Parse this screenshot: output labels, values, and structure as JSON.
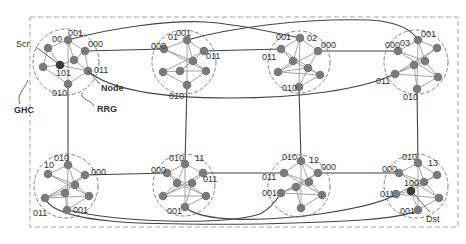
{
  "diagram": {
    "labels": {
      "ghc": "GHC",
      "rrg": "RRG",
      "node": "Node",
      "src": "Scr.",
      "dst": "Dst"
    },
    "colors": {
      "node": "#7a7a7a",
      "special_node": "#3a3a3a",
      "edge_inner": "#9a9a9a",
      "edge_outer": "#444444",
      "boundary": "#999999",
      "text": "#333333"
    },
    "boundary": {
      "x": 30,
      "y": 17,
      "w": 428,
      "h": 210
    },
    "clusters": [
      {
        "id": "00",
        "cx": 66,
        "cy": 62,
        "r": 33,
        "nodes": [
          [
            68,
            40
          ],
          [
            85,
            51
          ],
          [
            48,
            48
          ],
          [
            74,
            60
          ],
          [
            43,
            67
          ],
          [
            60,
            65
          ],
          [
            88,
            71
          ],
          [
            68,
            84
          ]
        ],
        "special": 5,
        "ports": [
          {
            "t": "001",
            "x": 68,
            "y": 36
          },
          {
            "t": "000",
            "x": 88,
            "y": 47
          },
          {
            "t": "011",
            "x": 94,
            "y": 73
          },
          {
            "t": "010",
            "x": 52,
            "y": 96
          },
          {
            "t": "101",
            "x": 56,
            "y": 76
          }
        ],
        "name_label": {
          "t": "00",
          "x": 52,
          "y": 42
        }
      },
      {
        "id": "01",
        "cx": 184,
        "cy": 62,
        "r": 32,
        "nodes": [
          [
            187,
            40
          ],
          [
            164,
            49
          ],
          [
            204,
            51
          ],
          [
            193,
            61
          ],
          [
            163,
            72
          ],
          [
            180,
            71
          ],
          [
            206,
            71
          ],
          [
            187,
            85
          ]
        ],
        "ports": [
          {
            "t": "001",
            "x": 176,
            "y": 36
          },
          {
            "t": "000",
            "x": 151,
            "y": 49
          },
          {
            "t": "011",
            "x": 206,
            "y": 59
          },
          {
            "t": "010",
            "x": 169,
            "y": 99
          }
        ],
        "name_label": {
          "t": "01",
          "x": 168,
          "y": 40
        }
      },
      {
        "id": "02",
        "cx": 299,
        "cy": 62,
        "r": 31,
        "nodes": [
          [
            300,
            38
          ],
          [
            281,
            49
          ],
          [
            318,
            51
          ],
          [
            293,
            61
          ],
          [
            308,
            68
          ],
          [
            278,
            72
          ],
          [
            320,
            75
          ],
          [
            299,
            87
          ]
        ],
        "ports": [
          {
            "t": "001",
            "x": 276,
            "y": 40
          },
          {
            "t": "000",
            "x": 321,
            "y": 48
          },
          {
            "t": "011",
            "x": 262,
            "y": 60
          },
          {
            "t": "010",
            "x": 282,
            "y": 91
          }
        ],
        "name_label": {
          "t": "02",
          "x": 307,
          "y": 41
        }
      },
      {
        "id": "03",
        "cx": 416,
        "cy": 62,
        "r": 32,
        "nodes": [
          [
            418,
            40
          ],
          [
            398,
            51
          ],
          [
            437,
            48
          ],
          [
            425,
            61
          ],
          [
            414,
            65
          ],
          [
            395,
            74
          ],
          [
            438,
            77
          ],
          [
            417,
            89
          ]
        ],
        "ports": [
          {
            "t": "001",
            "x": 421,
            "y": 37
          },
          {
            "t": "000",
            "x": 385,
            "y": 48
          },
          {
            "t": "011",
            "x": 376,
            "y": 84
          },
          {
            "t": "010",
            "x": 403,
            "y": 100
          }
        ],
        "name_label": {
          "t": "03",
          "x": 400,
          "y": 46
        }
      },
      {
        "id": "10",
        "cx": 66,
        "cy": 186,
        "r": 32,
        "nodes": [
          [
            68,
            165
          ],
          [
            48,
            174
          ],
          [
            85,
            175
          ],
          [
            75,
            185
          ],
          [
            65,
            193
          ],
          [
            45,
            198
          ],
          [
            89,
            196
          ],
          [
            67,
            210
          ]
        ],
        "ports": [
          {
            "t": "010",
            "x": 54,
            "y": 161
          },
          {
            "t": "000",
            "x": 91,
            "y": 175
          },
          {
            "t": "011",
            "x": 33,
            "y": 216
          },
          {
            "t": "001",
            "x": 73,
            "y": 213
          }
        ],
        "name_label": {
          "t": "10",
          "x": 44,
          "y": 168
        }
      },
      {
        "id": "11",
        "cx": 184,
        "cy": 185,
        "r": 31,
        "nodes": [
          [
            185,
            164
          ],
          [
            167,
            173
          ],
          [
            203,
            173
          ],
          [
            177,
            183
          ],
          [
            192,
            183
          ],
          [
            163,
            196
          ],
          [
            206,
            196
          ],
          [
            185,
            207
          ]
        ],
        "ports": [
          {
            "t": "010",
            "x": 169,
            "y": 161
          },
          {
            "t": "000",
            "x": 151,
            "y": 173
          },
          {
            "t": "011",
            "x": 203,
            "y": 182
          },
          {
            "t": "001",
            "x": 167,
            "y": 214
          }
        ],
        "name_label": {
          "t": "11",
          "x": 195,
          "y": 161
        }
      },
      {
        "id": "12",
        "cx": 299,
        "cy": 186,
        "r": 31,
        "nodes": [
          [
            301,
            161
          ],
          [
            284,
            173
          ],
          [
            318,
            173
          ],
          [
            309,
            182
          ],
          [
            296,
            187
          ],
          [
            281,
            193
          ],
          [
            322,
            195
          ],
          [
            301,
            208
          ]
        ],
        "ports": [
          {
            "t": "010",
            "x": 282,
            "y": 160
          },
          {
            "t": "000",
            "x": 321,
            "y": 170
          },
          {
            "t": "011",
            "x": 262,
            "y": 180
          },
          {
            "t": "001",
            "x": 262,
            "y": 196
          }
        ],
        "name_label": {
          "t": "12",
          "x": 309,
          "y": 163
        }
      },
      {
        "id": "13",
        "cx": 416,
        "cy": 186,
        "r": 32,
        "nodes": [
          [
            418,
            163
          ],
          [
            399,
            173
          ],
          [
            437,
            175
          ],
          [
            424,
            182
          ],
          [
            411,
            191
          ],
          [
            396,
            194
          ],
          [
            439,
            198
          ],
          [
            418,
            210
          ]
        ],
        "special": 4,
        "ports": [
          {
            "t": "010",
            "x": 402,
            "y": 160
          },
          {
            "t": "000",
            "x": 382,
            "y": 172
          },
          {
            "t": "011",
            "x": 380,
            "y": 197
          },
          {
            "t": "001",
            "x": 400,
            "y": 214
          },
          {
            "t": "100",
            "x": 404,
            "y": 186
          }
        ],
        "name_label": {
          "t": "13",
          "x": 428,
          "y": 166
        }
      }
    ],
    "inner_edges": [
      [
        0,
        1
      ],
      [
        0,
        2
      ],
      [
        0,
        3
      ],
      [
        1,
        3
      ],
      [
        1,
        6
      ],
      [
        2,
        4
      ],
      [
        2,
        5
      ],
      [
        3,
        5
      ],
      [
        4,
        5
      ],
      [
        4,
        7
      ],
      [
        5,
        6
      ],
      [
        6,
        7
      ],
      [
        0,
        7
      ],
      [
        3,
        6
      ]
    ]
  }
}
